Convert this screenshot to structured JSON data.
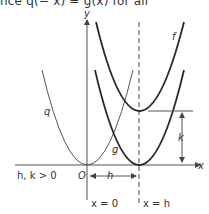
{
  "header": {
    "text": "nce q(− x) = g(x)   for all"
  },
  "diagram": {
    "axes": {
      "x_label": "x",
      "y_label": "y",
      "origin_label": "O"
    },
    "curves": [
      {
        "name": "f",
        "label": "f",
        "style": "thick",
        "vertex": "(h, k)"
      },
      {
        "name": "g",
        "label": "g",
        "style": "thick",
        "vertex": "(h, 0)"
      },
      {
        "name": "q",
        "label": "q",
        "style": "thin",
        "vertex": "(0, 0)"
      }
    ],
    "labels": {
      "f": "f",
      "g": "g",
      "q": "q",
      "k": "k",
      "h": "h",
      "condition": "h, k > 0",
      "line_x0": "x = 0",
      "line_xh": "x = h"
    },
    "colors": {
      "ink": "#2a2a2a",
      "thin": "#555555",
      "background": "#ffffff"
    }
  }
}
